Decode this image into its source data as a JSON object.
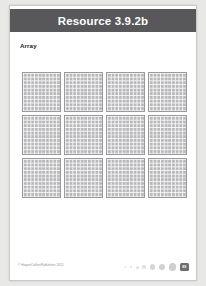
{
  "page": {
    "header": {
      "title": "Resource 3.9.2b"
    },
    "section": {
      "label": "Array"
    },
    "array_board": {
      "columns": 4,
      "rows": 3,
      "grid_count": 12,
      "cells_per_grid": "10 x 10",
      "grids": [
        {
          "id": "grid-1"
        },
        {
          "id": "grid-2"
        },
        {
          "id": "grid-3"
        },
        {
          "id": "grid-4"
        },
        {
          "id": "grid-5"
        },
        {
          "id": "grid-6"
        },
        {
          "id": "grid-7"
        },
        {
          "id": "grid-8"
        },
        {
          "id": "grid-9"
        },
        {
          "id": "grid-10"
        },
        {
          "id": "grid-11"
        },
        {
          "id": "grid-12"
        }
      ]
    },
    "footer": {
      "copyright": "© HarperCollinsPublishers 2015",
      "page_number": "89",
      "dots": [
        "d1",
        "d2",
        "d3",
        "d4",
        "d5",
        "d6",
        "d7"
      ]
    }
  },
  "colors": {
    "header_bar": "#58585a",
    "header_text": "#ffffff",
    "page_background": "#ffffff",
    "outer_background": "#e8e8e6",
    "grid_fill": "#b9b9bc",
    "grid_border": "#9a9a9d",
    "badge": "#6f6f72"
  }
}
